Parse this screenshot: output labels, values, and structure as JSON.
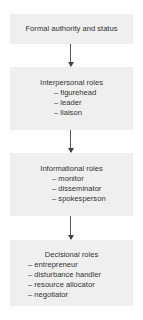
{
  "diagram": {
    "boxes": [
      {
        "title": "Formal authority and status",
        "items": []
      },
      {
        "title": "Interpersonal roles",
        "items": [
          "– figurehead",
          "– leader",
          "– liaison"
        ]
      },
      {
        "title": "Informational roles",
        "items": [
          "– monitor",
          "– disseminator",
          "– spokesperson"
        ]
      },
      {
        "title": "Decisional roles",
        "items": [
          "– entrepreneur",
          "– disturbance handler",
          "– resource allocator",
          "– negotiator"
        ]
      }
    ],
    "colors": {
      "box_fill": "#efefef",
      "text": "#333333",
      "arrow": "#555555"
    }
  }
}
